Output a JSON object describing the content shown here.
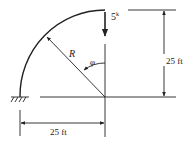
{
  "diagram": {
    "type": "curved cantilever beam (quarter circle arch)",
    "load": {
      "label": "5",
      "unit_superscript": "k",
      "direction": "downward"
    },
    "radius_label": "R",
    "angle_label": "φ",
    "vertical_dimension": "25 ft",
    "horizontal_dimension": "25 ft",
    "support": "fixed",
    "colors": {
      "line": "#222222",
      "background": "#ffffff"
    }
  }
}
